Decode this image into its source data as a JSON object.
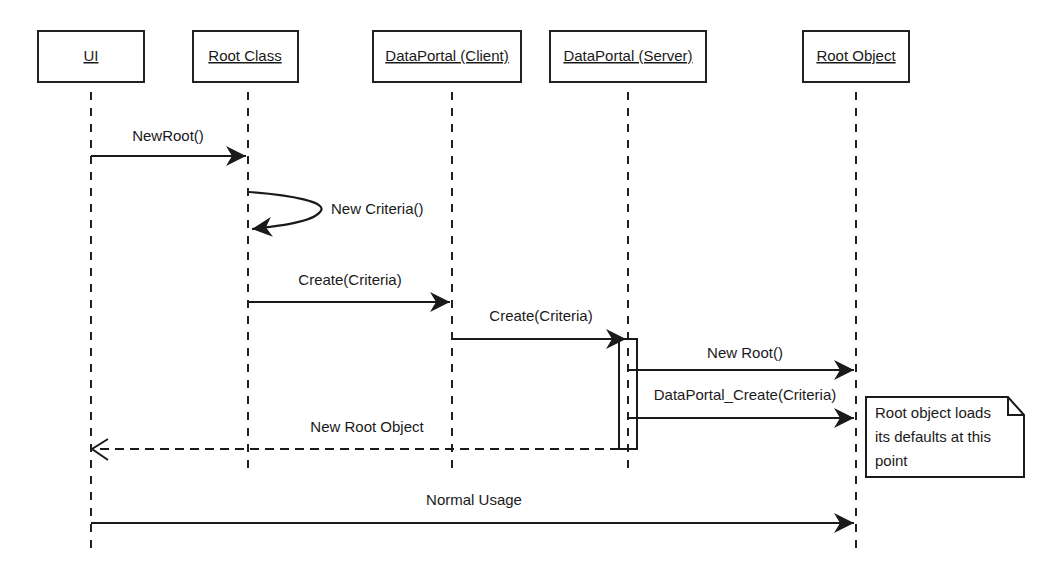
{
  "diagram": {
    "type": "uml-sequence",
    "participants": [
      {
        "id": "ui",
        "label": "UI"
      },
      {
        "id": "root_class",
        "label": "Root Class"
      },
      {
        "id": "dp_client",
        "label": "DataPortal (Client)"
      },
      {
        "id": "dp_server",
        "label": "DataPortal (Server)"
      },
      {
        "id": "root_object",
        "label": "Root Object"
      }
    ],
    "messages": [
      {
        "from": "ui",
        "to": "root_class",
        "label": "NewRoot()",
        "kind": "sync"
      },
      {
        "from": "root_class",
        "to": "root_class",
        "label": "New Criteria()",
        "kind": "self"
      },
      {
        "from": "root_class",
        "to": "dp_client",
        "label": "Create(Criteria)",
        "kind": "sync"
      },
      {
        "from": "dp_client",
        "to": "dp_server",
        "label": "Create(Criteria)",
        "kind": "sync"
      },
      {
        "from": "dp_server",
        "to": "root_object",
        "label": "New Root()",
        "kind": "sync"
      },
      {
        "from": "dp_server",
        "to": "root_object",
        "label": "DataPortal_Create(Criteria)",
        "kind": "sync"
      },
      {
        "from": "dp_server",
        "to": "ui",
        "label": "New Root Object",
        "kind": "return"
      },
      {
        "from": "ui",
        "to": "root_object",
        "label": "Normal Usage",
        "kind": "sync"
      }
    ],
    "note": {
      "attached_to": "root_object",
      "lines": [
        "Root object loads",
        "its defaults at this",
        "point"
      ]
    },
    "colors": {
      "ink": "#1a1a1a",
      "background": "#ffffff"
    }
  }
}
